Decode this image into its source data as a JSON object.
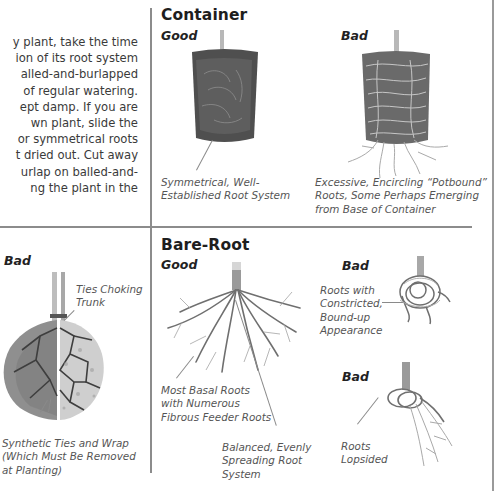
{
  "intro_paragraph": {
    "lines": [
      "y plant, take the time",
      "ion of its root system",
      "alled-and-burlapped",
      "of regular watering.",
      "ept damp. If you are",
      "wn plant, slide the",
      "or symmetrical roots",
      "t dried out. Cut away",
      "urlap on balled-and-",
      "ng the plant in the"
    ]
  },
  "balled_burlapped": {
    "bad_label": "Bad",
    "callout_ties": [
      "Ties Choking",
      "Trunk"
    ],
    "callout_wrap": [
      "Synthetic Ties and Wrap",
      "(Which Must Be Removed",
      "at Planting)"
    ]
  },
  "container": {
    "title": "Container",
    "good_label": "Good",
    "bad_label": "Bad",
    "good_caption": [
      "Symmetrical, Well-",
      "Established Root System"
    ],
    "bad_caption": [
      "Excessive, Encircling “Potbound”",
      "Roots, Some Perhaps Emerging",
      "from Base of Container"
    ]
  },
  "bare_root": {
    "title": "Bare-Root",
    "good_label": "Good",
    "good_caption_basal": [
      "Most Basal Roots",
      "with Numerous",
      "Fibrous Feeder Roots"
    ],
    "good_caption_balanced": [
      "Balanced, Evenly",
      "Spreading Root",
      "System"
    ],
    "bad1_label": "Bad",
    "bad1_caption": [
      "Roots with",
      "Constricted,",
      "Bound-up",
      "Appearance"
    ],
    "bad2_label": "Bad",
    "bad2_caption": [
      "Roots",
      "Lopsided"
    ]
  },
  "colors": {
    "divider": "#8c8c8c",
    "soil_dark": "#4a4a4a",
    "root": "#8a8a8a",
    "caption_text": "#555555"
  }
}
